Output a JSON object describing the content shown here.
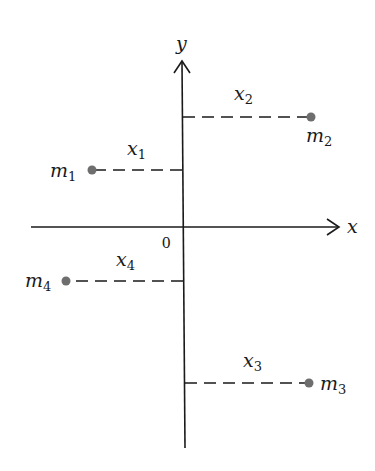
{
  "diagram": {
    "axes": {
      "x_label": "x",
      "y_label": "y",
      "origin_label": "0"
    },
    "masses": [
      {
        "name": "m",
        "sub": "1",
        "dist_name": "x",
        "dist_sub": "1",
        "quadrant": "upper-left"
      },
      {
        "name": "m",
        "sub": "2",
        "dist_name": "x",
        "dist_sub": "2",
        "quadrant": "upper-right"
      },
      {
        "name": "m",
        "sub": "3",
        "dist_name": "x",
        "dist_sub": "3",
        "quadrant": "lower-right"
      },
      {
        "name": "m",
        "sub": "4",
        "dist_name": "x",
        "dist_sub": "4",
        "quadrant": "lower-left"
      }
    ],
    "colors": {
      "axis": "#1a1a1a",
      "point": "#6e6e6e"
    }
  }
}
